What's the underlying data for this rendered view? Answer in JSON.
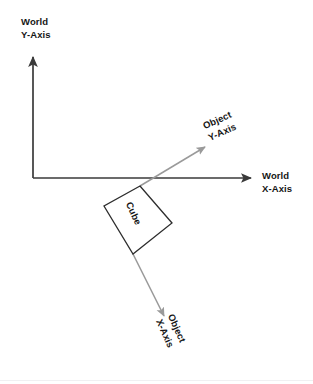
{
  "diagram": {
    "title_present": false,
    "labels": {
      "world_y": "World\nY-Axis",
      "world_x": "World\nX-Axis",
      "object_y": "Object\nY-Axis",
      "object_x": "Object\nX-Axis",
      "cube": "Cube"
    },
    "colors": {
      "world_axis": "#3a3a3a",
      "object_axis": "#9a9a9a",
      "cube_outline": "#2d2d2d",
      "text": "#161616",
      "background": "#ffffff"
    },
    "geometry": {
      "world_origin": {
        "x": 33,
        "y": 178
      },
      "world_y_tip": {
        "x": 33,
        "y": 54
      },
      "world_x_tip": {
        "x": 254,
        "y": 178
      },
      "cube_center": {
        "x": 138,
        "y": 220
      },
      "cube_side": 48,
      "cube_rotation_deg": 24,
      "cube_corners": {
        "top": {
          "x": 140,
          "y": 186
        },
        "left": {
          "x": 104,
          "y": 206
        },
        "bottom": {
          "x": 133,
          "y": 254
        },
        "right": {
          "x": 172,
          "y": 223
        }
      },
      "object_y_start": {
        "x": 140,
        "y": 186
      },
      "object_y_tip": {
        "x": 208,
        "y": 145
      },
      "object_x_start": {
        "x": 133,
        "y": 254
      },
      "object_x_tip": {
        "x": 166,
        "y": 320
      }
    },
    "label_rotations_deg": {
      "object_y": -24,
      "object_x": 66,
      "cube": 66
    }
  }
}
